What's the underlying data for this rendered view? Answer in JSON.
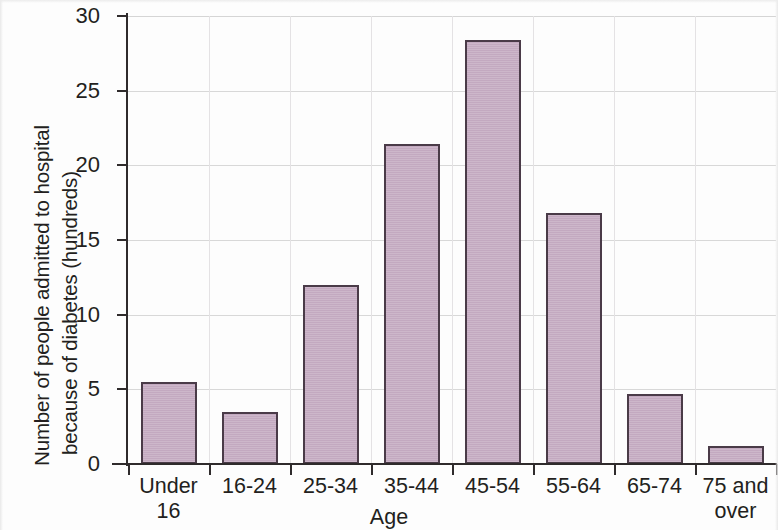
{
  "chart_data": {
    "type": "bar",
    "title": "",
    "xlabel": "Age",
    "ylabel_line1": "Number of people admitted to hospital",
    "ylabel_line2": "because of diabetes (hundreds)",
    "categories": [
      "Under 16",
      "16-24",
      "25-34",
      "35-44",
      "45-54",
      "55-64",
      "65-74",
      "75 and over"
    ],
    "category_lines": [
      [
        "Under",
        "16"
      ],
      [
        "16-24",
        ""
      ],
      [
        "25-34",
        ""
      ],
      [
        "35-44",
        ""
      ],
      [
        "45-54",
        ""
      ],
      [
        "55-64",
        ""
      ],
      [
        "65-74",
        ""
      ],
      [
        "75 and",
        "over"
      ]
    ],
    "values": [
      5.5,
      3.5,
      12.0,
      21.4,
      28.4,
      16.8,
      4.7,
      1.2
    ],
    "ylim": [
      0,
      30
    ],
    "ytick_values": [
      0,
      5,
      10,
      15,
      20,
      25,
      30
    ],
    "ytick_labels": [
      "0",
      "5",
      "10",
      "15",
      "20",
      "25",
      "30"
    ],
    "grid": "horizontal-and-vertical-faint",
    "legend": "none",
    "bar_fill_color": "#c3a9c0",
    "bar_border_color": "#4a3b48",
    "gridline_color": "#d8d8d8",
    "axis_color": "#2f2b2c",
    "background_color": "#fdfdfd"
  }
}
